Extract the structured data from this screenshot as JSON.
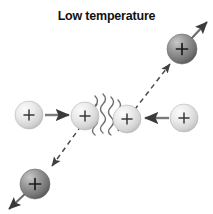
{
  "figure": {
    "title": "Low temperature",
    "background_color": "#ffffff",
    "width": 213,
    "height": 214
  },
  "colors": {
    "title_text": "#111111",
    "light_ion_fill": "#e2e2e2",
    "light_ion_highlight": "#f7f7f7",
    "light_ion_shadow": "#bdbdbd",
    "dark_ion_fill": "#8e8e8e",
    "dark_ion_highlight": "#c2c2c2",
    "dark_ion_shadow": "#585858",
    "arrow_solid": "#7a7a7a",
    "arrow_dark": "#3a3a3a",
    "dashed_line": "#4a4a4a",
    "wavy_line": "#707070",
    "charge_symbol": "#1a1a1a"
  },
  "particles": [
    {
      "id": "ion-top-right",
      "label": "+",
      "shade": "dark",
      "cx": 182,
      "cy": 49,
      "r": 15
    },
    {
      "id": "ion-left-incoming",
      "label": "+",
      "shade": "light",
      "cx": 29,
      "cy": 115,
      "r": 14
    },
    {
      "id": "ion-center-left",
      "label": "+",
      "shade": "light",
      "cx": 85,
      "cy": 116,
      "r": 14
    },
    {
      "id": "ion-center-right",
      "label": "+",
      "shade": "light",
      "cx": 127,
      "cy": 119,
      "r": 14
    },
    {
      "id": "ion-right-incoming",
      "label": "+",
      "shade": "light",
      "cx": 184,
      "cy": 118,
      "r": 14
    },
    {
      "id": "ion-bottom-left",
      "label": "+",
      "shade": "dark",
      "cx": 35,
      "cy": 184,
      "r": 15
    }
  ],
  "velocity_arrows": [
    {
      "id": "arrow-left-rightward",
      "style": "solid",
      "x1": 45,
      "y1": 115,
      "x2": 70,
      "y2": 115,
      "direction": "right"
    },
    {
      "id": "arrow-right-leftward",
      "style": "solid",
      "x1": 168,
      "y1": 118,
      "x2": 143,
      "y2": 118,
      "direction": "left"
    },
    {
      "id": "arrow-top-right-outgoing",
      "style": "solid",
      "x1": 192,
      "y1": 38,
      "x2": 208,
      "y2": 21,
      "direction": "up-right"
    },
    {
      "id": "arrow-bottom-left-outgoing",
      "style": "solid",
      "x1": 25,
      "y1": 194,
      "x2": 8,
      "y2": 210,
      "direction": "down-left"
    }
  ],
  "trajectory": {
    "id": "dashed-deflection-path",
    "style": "dashed",
    "upper_segment": {
      "x1": 118,
      "y1": 131,
      "x2": 167,
      "y2": 62,
      "arrowhead": "up-right"
    },
    "lower_segment": {
      "x1": 97,
      "y1": 104,
      "x2": 48,
      "y2": 171,
      "arrowhead": "down-left"
    }
  },
  "repulsion_waves": {
    "id": "coulomb-repulsion-waves",
    "count": 4,
    "orientation": "diagonal",
    "color": "#707070"
  }
}
